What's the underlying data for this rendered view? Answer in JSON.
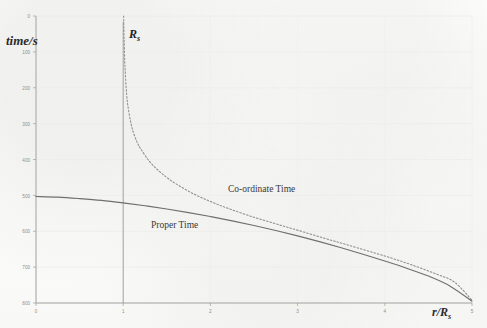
{
  "figure": {
    "title": "",
    "background_color": "#fdfdfc",
    "ink_color": "#555555"
  },
  "axes": {
    "y_title": "time/s",
    "x_title": "r/R",
    "x_title_sub": "s",
    "y_ticks": [
      "800",
      "700",
      "600",
      "500",
      "400",
      "300",
      "200",
      "100",
      "0"
    ],
    "x_ticks": [
      "0",
      "1",
      "2",
      "3",
      "4",
      "5"
    ]
  },
  "annotations": {
    "asymptote_label": "R",
    "asymptote_label_sub": "s",
    "coordinate_time_label": "Co-ordinate Time",
    "proper_time_label": "Proper Time"
  },
  "chart_data": {
    "type": "line",
    "title": "",
    "xlabel": "r/R_s",
    "ylabel": "time/s",
    "xlim": [
      0,
      5
    ],
    "ylim": [
      0,
      800
    ],
    "grid": true,
    "legend": "inline-annotations",
    "x_ticks": [
      0,
      1,
      2,
      3,
      4,
      5
    ],
    "y_ticks": [
      0,
      100,
      200,
      300,
      400,
      500,
      600,
      700,
      800
    ],
    "asymptote": {
      "label": "R_s",
      "x": 1,
      "style": "solid-thin-vertical",
      "color": "#9a9a9a"
    },
    "series": [
      {
        "name": "Co-ordinate Time",
        "style": "dotted",
        "color": "#8d8d8d",
        "x": [
          1.005,
          1.01,
          1.02,
          1.04,
          1.06,
          1.09,
          1.12,
          1.16,
          1.2,
          1.3,
          1.4,
          1.5,
          1.6,
          1.8,
          2.0,
          2.2,
          2.5,
          2.8,
          3.0,
          3.3,
          3.6,
          4.0,
          4.3,
          4.6,
          4.8,
          5.0
        ],
        "y": [
          800,
          740,
          660,
          580,
          540,
          500,
          473,
          448,
          430,
          395,
          370,
          350,
          333,
          305,
          283,
          264,
          239,
          217,
          203,
          181,
          160,
          131,
          107,
          80,
          58,
          8
        ]
      },
      {
        "name": "Proper Time",
        "style": "solid",
        "color": "#6f6f6f",
        "x": [
          0,
          0.25,
          0.5,
          0.75,
          1.0,
          1.25,
          1.5,
          1.75,
          2.0,
          2.25,
          2.5,
          2.75,
          3.0,
          3.25,
          3.5,
          3.75,
          4.0,
          4.25,
          4.5,
          4.75,
          5.0
        ],
        "y": [
          297,
          295,
          291,
          286,
          279,
          271,
          262,
          252,
          241,
          229,
          216,
          202,
          187,
          171,
          154,
          136,
          117,
          97,
          75,
          47,
          5
        ]
      }
    ]
  }
}
